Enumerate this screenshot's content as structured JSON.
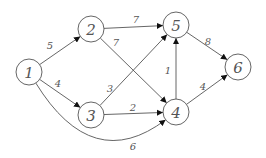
{
  "diagram": {
    "type": "weighted-directed-graph",
    "nodes": [
      {
        "id": "1",
        "label": "1",
        "x": 29,
        "y": 72
      },
      {
        "id": "2",
        "label": "2",
        "x": 91,
        "y": 29
      },
      {
        "id": "3",
        "label": "3",
        "x": 91,
        "y": 115
      },
      {
        "id": "4",
        "label": "4",
        "x": 176,
        "y": 112
      },
      {
        "id": "5",
        "label": "5",
        "x": 176,
        "y": 25
      },
      {
        "id": "6",
        "label": "6",
        "x": 238,
        "y": 67
      }
    ],
    "edges": [
      {
        "from": "1",
        "to": "2",
        "weight": "5",
        "lx": 50,
        "ly": 45
      },
      {
        "from": "1",
        "to": "3",
        "weight": "4",
        "lx": 58,
        "ly": 83
      },
      {
        "from": "1",
        "to": "4",
        "weight": "6",
        "lx": 133,
        "ly": 146,
        "curved": true
      },
      {
        "from": "2",
        "to": "5",
        "weight": "7",
        "lx": 136,
        "ly": 19
      },
      {
        "from": "2",
        "to": "4",
        "weight": "7",
        "lx": 116,
        "ly": 42
      },
      {
        "from": "3",
        "to": "5",
        "weight": "3",
        "lx": 110,
        "ly": 88
      },
      {
        "from": "3",
        "to": "4",
        "weight": "2",
        "lx": 133,
        "ly": 107
      },
      {
        "from": "4",
        "to": "5",
        "weight": "1",
        "lx": 168,
        "ly": 70
      },
      {
        "from": "4",
        "to": "6",
        "weight": "4",
        "lx": 203,
        "ly": 86
      },
      {
        "from": "5",
        "to": "6",
        "weight": "8",
        "lx": 208,
        "ly": 41
      }
    ]
  }
}
